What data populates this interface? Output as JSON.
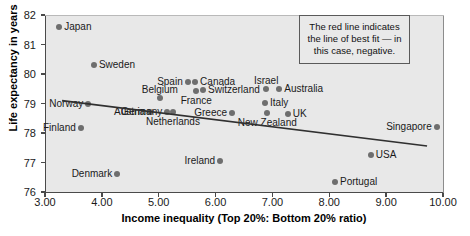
{
  "chart_data": {
    "type": "scatter",
    "title": "",
    "xlabel": "Income inequality (Top 20%: Bottom 20% ratio)",
    "ylabel": "Life expectancy in years",
    "xlim": [
      3.0,
      10.0
    ],
    "ylim": [
      76,
      82
    ],
    "xticks": [
      "3.00",
      "4.00",
      "5.00",
      "6.00",
      "7.00",
      "8.00",
      "9.00",
      "10.00"
    ],
    "xtick_values": [
      3,
      4,
      5,
      6,
      7,
      8,
      9,
      10
    ],
    "yticks": [
      "76",
      "77",
      "78",
      "79",
      "80",
      "81",
      "82"
    ],
    "ytick_values": [
      76,
      77,
      78,
      79,
      80,
      81,
      82
    ],
    "grid": false,
    "legend": "none",
    "point_color": "#6e6e6e",
    "plot_background": "#e8e8e8",
    "trendline": {
      "label": "line of best fit",
      "color": "#303030",
      "direction": "negative",
      "x_start": 3.3,
      "y_start": 79.1,
      "x_end": 9.72,
      "y_end": 77.56
    },
    "points": [
      {
        "name": "Japan",
        "x": 3.25,
        "y": 81.6,
        "label_pos": "right"
      },
      {
        "name": "Sweden",
        "x": 3.86,
        "y": 80.3,
        "label_pos": "right"
      },
      {
        "name": "Norway",
        "x": 3.76,
        "y": 78.98,
        "label_pos": "left"
      },
      {
        "name": "Finland",
        "x": 3.63,
        "y": 78.17,
        "label_pos": "left"
      },
      {
        "name": "Denmark",
        "x": 4.27,
        "y": 76.6,
        "label_pos": "left"
      },
      {
        "name": "Belgium",
        "x": 5.02,
        "y": 79.19,
        "label_pos": "above"
      },
      {
        "name": "Austria",
        "x": 4.85,
        "y": 78.71,
        "label_pos": "left"
      },
      {
        "name": "Germany",
        "x": 5.15,
        "y": 78.71,
        "label_pos": "left"
      },
      {
        "name": "Spain",
        "x": 5.51,
        "y": 79.73,
        "label_pos": "left"
      },
      {
        "name": "Canada",
        "x": 5.64,
        "y": 79.73,
        "label_pos": "right"
      },
      {
        "name": "France",
        "x": 5.66,
        "y": 79.42,
        "label_pos": "below"
      },
      {
        "name": "Switzerland",
        "x": 5.78,
        "y": 79.46,
        "label_pos": "right"
      },
      {
        "name": "Netherlands",
        "x": 5.25,
        "y": 78.71,
        "label_pos": "below"
      },
      {
        "name": "Greece",
        "x": 6.29,
        "y": 78.68,
        "label_pos": "left"
      },
      {
        "name": "Israel",
        "x": 6.89,
        "y": 79.49,
        "label_pos": "above"
      },
      {
        "name": "Australia",
        "x": 7.12,
        "y": 79.49,
        "label_pos": "right"
      },
      {
        "name": "Italy",
        "x": 6.87,
        "y": 79.02,
        "label_pos": "right"
      },
      {
        "name": "New Zealand",
        "x": 6.91,
        "y": 78.68,
        "label_pos": "below"
      },
      {
        "name": "UK",
        "x": 7.27,
        "y": 78.64,
        "label_pos": "right"
      },
      {
        "name": "Ireland",
        "x": 6.08,
        "y": 77.05,
        "label_pos": "left"
      },
      {
        "name": "Portugal",
        "x": 8.1,
        "y": 76.34,
        "label_pos": "right"
      },
      {
        "name": "USA",
        "x": 8.73,
        "y": 77.25,
        "label_pos": "right"
      },
      {
        "name": "Singapore",
        "x": 9.89,
        "y": 78.2,
        "label_pos": "left"
      }
    ],
    "annotation": "The red line indicates the line of best fit — in this case, negative."
  }
}
